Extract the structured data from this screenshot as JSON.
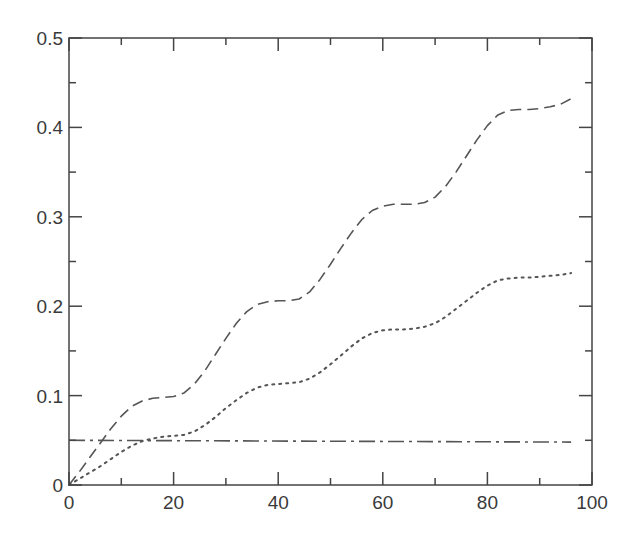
{
  "chart_data": {
    "type": "line",
    "title": "",
    "xlabel": "",
    "ylabel": "",
    "xlim": [
      0,
      100
    ],
    "ylim": [
      0,
      0.5
    ],
    "grid": false,
    "legend": null,
    "x_ticks": [
      0,
      20,
      40,
      60,
      80,
      100
    ],
    "x_tick_labels": [
      "0",
      "20",
      "40",
      "60",
      "80",
      "100"
    ],
    "x_minor_ticks": [
      10,
      30,
      50,
      70,
      90
    ],
    "y_ticks": [
      0,
      0.1,
      0.2,
      0.3,
      0.4,
      0.5
    ],
    "y_tick_labels": [
      "0",
      "0.1",
      "0.2",
      "0.3",
      "0.4",
      "0.5"
    ],
    "y_minor_ticks": [
      0.05,
      0.15,
      0.25,
      0.35,
      0.45
    ],
    "series": [
      {
        "name": "dashed",
        "style": "dashed",
        "color": "#555555",
        "x": [
          0,
          2,
          4,
          6,
          8,
          10,
          12,
          14,
          16,
          18,
          20,
          22,
          24,
          26,
          28,
          30,
          32,
          34,
          36,
          38,
          40,
          42,
          44,
          46,
          48,
          50,
          52,
          54,
          56,
          58,
          60,
          62,
          64,
          66,
          68,
          70,
          72,
          74,
          76,
          78,
          80,
          82,
          84,
          86,
          88,
          90,
          92,
          94,
          96
        ],
        "y": [
          0,
          0.015,
          0.031,
          0.047,
          0.063,
          0.077,
          0.088,
          0.094,
          0.097,
          0.098,
          0.099,
          0.103,
          0.113,
          0.128,
          0.146,
          0.164,
          0.181,
          0.194,
          0.202,
          0.205,
          0.206,
          0.206,
          0.208,
          0.216,
          0.23,
          0.247,
          0.265,
          0.282,
          0.297,
          0.307,
          0.312,
          0.314,
          0.314,
          0.314,
          0.316,
          0.322,
          0.334,
          0.35,
          0.368,
          0.386,
          0.402,
          0.414,
          0.419,
          0.42,
          0.42,
          0.421,
          0.423,
          0.426,
          0.432
        ]
      },
      {
        "name": "dotted",
        "style": "dotted",
        "color": "#555555",
        "x": [
          0,
          2,
          4,
          6,
          8,
          10,
          12,
          14,
          16,
          18,
          20,
          22,
          24,
          26,
          28,
          30,
          32,
          34,
          36,
          38,
          40,
          42,
          44,
          46,
          48,
          50,
          52,
          54,
          56,
          58,
          60,
          62,
          64,
          66,
          68,
          70,
          72,
          74,
          76,
          78,
          80,
          82,
          84,
          86,
          88,
          90,
          92,
          94,
          96
        ],
        "y": [
          0,
          0.007,
          0.014,
          0.021,
          0.029,
          0.037,
          0.044,
          0.049,
          0.052,
          0.054,
          0.055,
          0.056,
          0.06,
          0.067,
          0.076,
          0.086,
          0.095,
          0.103,
          0.109,
          0.112,
          0.113,
          0.114,
          0.115,
          0.119,
          0.126,
          0.135,
          0.145,
          0.155,
          0.164,
          0.17,
          0.173,
          0.174,
          0.174,
          0.175,
          0.177,
          0.181,
          0.188,
          0.197,
          0.206,
          0.215,
          0.223,
          0.229,
          0.231,
          0.232,
          0.232,
          0.233,
          0.234,
          0.235,
          0.237
        ]
      },
      {
        "name": "dash-dot",
        "style": "dashdot",
        "color": "#555555",
        "x": [
          0,
          96
        ],
        "y": [
          0.05,
          0.048
        ]
      }
    ]
  },
  "layout": {
    "plot_left": 69,
    "plot_right": 592,
    "plot_top": 38,
    "plot_bottom": 485,
    "axis_color": "#444444"
  }
}
